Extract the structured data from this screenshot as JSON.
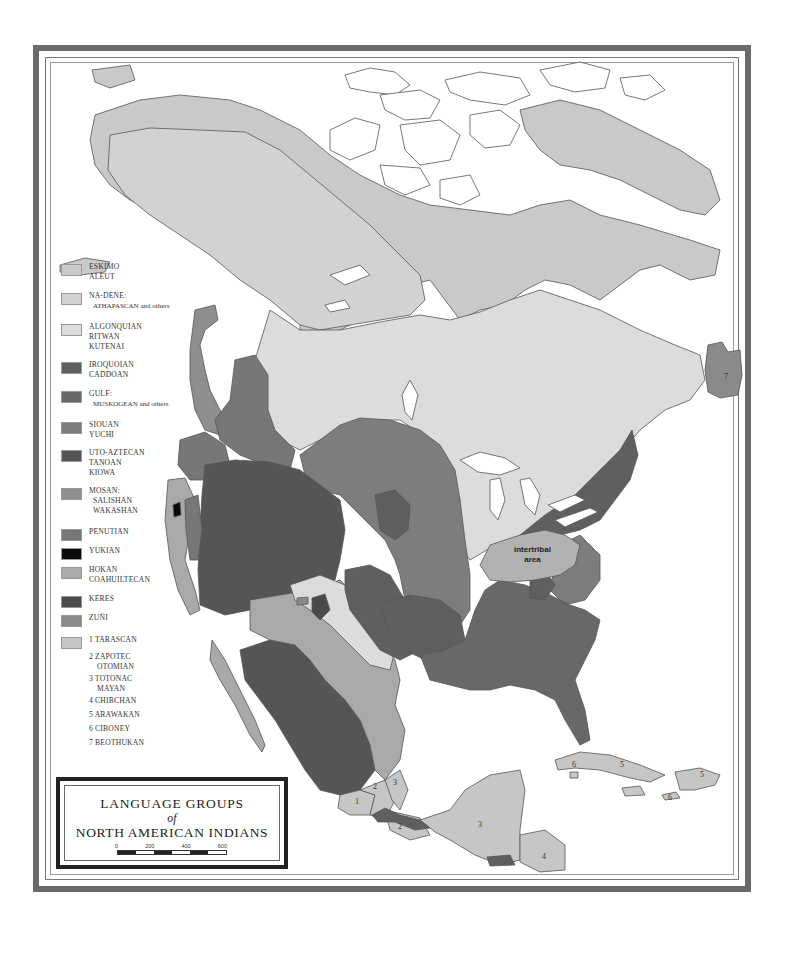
{
  "title": {
    "line1": "LANGUAGE GROUPS",
    "line2": "of",
    "line3": "NORTH AMERICAN INDIANS"
  },
  "scale": {
    "labels": [
      "0",
      "200",
      "400",
      "600"
    ]
  },
  "colors": {
    "eskimo_aleut": "#c9c9c9",
    "na_dene": "#d2d2d2",
    "algonquian": "#dcdcdc",
    "iroquoian": "#5f5f5f",
    "gulf": "#686868",
    "siouan": "#7d7d7d",
    "uto_aztecan": "#555555",
    "mosan": "#8e8e8e",
    "penutian": "#777777",
    "yukian": "#0a0a0a",
    "hokan": "#a9a9a9",
    "keres": "#4a4a4a",
    "zuni": "#8a8a8a",
    "tarascan_group": "#c6c6c6",
    "water": "#ffffff",
    "frame": "#6a6a6a"
  },
  "legend": [
    {
      "lines": [
        "ESKIMO",
        "ALEUT"
      ],
      "color_key": "eskimo_aleut"
    },
    {
      "lines": [
        "NA-DENE:",
        "ATHAPASCAN and others"
      ],
      "color_key": "na_dene"
    },
    {
      "lines": [
        "ALGONQUIAN",
        "RITWAN",
        "KUTENAI"
      ],
      "color_key": "algonquian"
    },
    {
      "lines": [
        "IROQUOIAN",
        "CADDOAN"
      ],
      "color_key": "iroquoian"
    },
    {
      "lines": [
        "GULF:",
        "MUSKOGEAN and others"
      ],
      "color_key": "gulf"
    },
    {
      "lines": [
        "SIOUAN",
        "YUCHI"
      ],
      "color_key": "siouan"
    },
    {
      "lines": [
        "UTO-AZTECAN",
        "TANOAN",
        "KIOWA"
      ],
      "color_key": "uto_aztecan"
    },
    {
      "lines": [
        "MOSAN:",
        "SALISHAN",
        "WAKASHAN"
      ],
      "color_key": "mosan"
    },
    {
      "lines": [
        "PENUTIAN"
      ],
      "color_key": "penutian"
    },
    {
      "lines": [
        "YUKIAN"
      ],
      "color_key": "yukian"
    },
    {
      "lines": [
        "HOKAN",
        "COAHUILTECAN"
      ],
      "color_key": "hokan"
    },
    {
      "lines": [
        "KERES"
      ],
      "color_key": "keres"
    },
    {
      "lines": [
        "ZUÑI"
      ],
      "color_key": "zuni"
    },
    {
      "lines": [
        "1  TARASCAN"
      ],
      "color_key": "tarascan_group"
    }
  ],
  "numbered_groups": [
    {
      "lines": [
        "2  ZAPOTEC",
        "OTOMIAN"
      ]
    },
    {
      "lines": [
        "3  TOTONAC",
        "MAYAN"
      ]
    },
    {
      "lines": [
        "4  CHIBCHAN"
      ]
    },
    {
      "lines": [
        "5  ARAWAKAN"
      ]
    },
    {
      "lines": [
        "6  CIBONEY"
      ]
    },
    {
      "lines": [
        "7  BEOTHUKAN"
      ]
    }
  ],
  "map_labels": {
    "intertribal_line1": "intertribal",
    "intertribal_line2": "area",
    "n1": "1",
    "n2a": "2",
    "n2b": "2",
    "n3a": "3",
    "n3b": "3",
    "n4": "4",
    "n5a": "5",
    "n5b": "5",
    "n6a": "6",
    "n6b": "6",
    "n7": "7"
  }
}
